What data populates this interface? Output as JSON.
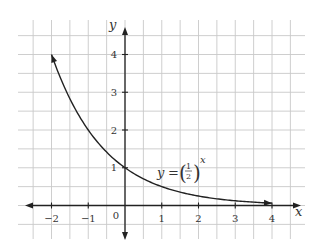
{
  "chart_data": {
    "type": "line",
    "title": "",
    "xlabel": "x",
    "ylabel": "y",
    "function": "y = (1/2)^x",
    "annotation": {
      "text_y": "y",
      "text_eq": "=",
      "frac_num": "1",
      "frac_den": "2",
      "exponent": "x",
      "position": [
        1.0,
        1.0
      ]
    },
    "xlim": [
      -2.5,
      4.5
    ],
    "ylim": [
      -0.5,
      4.5
    ],
    "x_ticks": [
      -2,
      -1,
      0,
      1,
      2,
      3,
      4
    ],
    "x_tick_labels": [
      "−2",
      "−1",
      "0",
      "1",
      "2",
      "3",
      "4"
    ],
    "y_ticks": [
      1,
      2,
      3,
      4
    ],
    "y_tick_labels": [
      "1",
      "2",
      "3",
      "4"
    ],
    "grid": true,
    "grid_spacing": 0.5,
    "legend": null,
    "series": [
      {
        "name": "y = (1/2)^x",
        "x": [
          -2,
          -1.5,
          -1,
          -0.5,
          0,
          0.5,
          1,
          1.5,
          2,
          2.5,
          3,
          3.5,
          4
        ],
        "y": [
          4,
          2.828,
          2,
          1.414,
          1,
          0.707,
          0.5,
          0.354,
          0.25,
          0.177,
          0.125,
          0.088,
          0.0625
        ],
        "arrows": "both-ends"
      }
    ]
  }
}
